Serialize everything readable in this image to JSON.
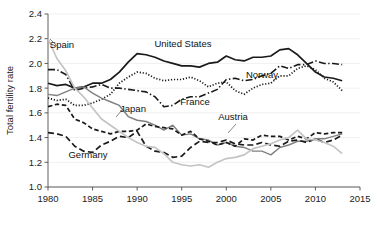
{
  "chart_data": {
    "type": "line",
    "title": "",
    "xlabel": "",
    "ylabel": "Total fertility rate",
    "xlim": [
      1980,
      2015
    ],
    "ylim": [
      1.0,
      2.4
    ],
    "grid": true,
    "legend_position": "inline-annotations",
    "xticks": [
      "1980",
      "1985",
      "1990",
      "1995",
      "2000",
      "2005",
      "2010",
      "2015"
    ],
    "xtick_values": [
      1980,
      1985,
      1990,
      1995,
      2000,
      2005,
      2010,
      2015
    ],
    "yticks": [
      "1.0",
      "1.2",
      "1.4",
      "1.6",
      "1.8",
      "2.0",
      "2.2",
      "2.4"
    ],
    "ytick_values": [
      1.0,
      1.2,
      1.4,
      1.6,
      1.8,
      2.0,
      2.2,
      2.4
    ],
    "x": [
      1980,
      1981,
      1982,
      1983,
      1984,
      1985,
      1986,
      1987,
      1988,
      1989,
      1990,
      1991,
      1992,
      1993,
      1994,
      1995,
      1996,
      1997,
      1998,
      1999,
      2000,
      2001,
      2002,
      2003,
      2004,
      2005,
      2006,
      2007,
      2008,
      2009,
      2010,
      2011,
      2012,
      2013
    ],
    "series": [
      {
        "name": "United States",
        "style": "solid",
        "color": "#1a1a1a",
        "label": "United States",
        "label_x": 183,
        "label_y": 47,
        "values": [
          1.84,
          1.82,
          1.83,
          1.8,
          1.81,
          1.84,
          1.84,
          1.87,
          1.93,
          2.01,
          2.08,
          2.07,
          2.05,
          2.02,
          2.0,
          1.98,
          1.98,
          1.97,
          2.0,
          2.01,
          2.06,
          2.03,
          2.02,
          2.05,
          2.05,
          2.06,
          2.11,
          2.12,
          2.07,
          2.0,
          1.93,
          1.89,
          1.88,
          1.86
        ]
      },
      {
        "name": "Norway",
        "style": "dotted",
        "color": "#1a1a1a",
        "label": "Norway",
        "label_x": 262,
        "label_y": 78,
        "values": [
          1.72,
          1.7,
          1.71,
          1.66,
          1.66,
          1.68,
          1.71,
          1.75,
          1.84,
          1.89,
          1.93,
          1.92,
          1.88,
          1.86,
          1.87,
          1.87,
          1.89,
          1.86,
          1.81,
          1.84,
          1.85,
          1.78,
          1.75,
          1.8,
          1.83,
          1.84,
          1.9,
          1.9,
          1.96,
          1.98,
          1.95,
          1.88,
          1.85,
          1.78
        ]
      },
      {
        "name": "France",
        "style": "dashdot",
        "color": "#1a1a1a",
        "label": "France",
        "label_x": 195,
        "label_y": 105,
        "values": [
          1.95,
          1.95,
          1.91,
          1.78,
          1.8,
          1.81,
          1.83,
          1.8,
          1.8,
          1.79,
          1.78,
          1.77,
          1.73,
          1.65,
          1.66,
          1.71,
          1.73,
          1.73,
          1.76,
          1.79,
          1.87,
          1.88,
          1.86,
          1.87,
          1.9,
          1.92,
          1.98,
          1.96,
          1.99,
          1.99,
          2.02,
          2.0,
          2.0,
          1.99
        ]
      },
      {
        "name": "Japan",
        "style": "solid-gray",
        "color": "#808080",
        "label": "Japan",
        "label_x": 133,
        "label_y": 112,
        "values": [
          1.75,
          1.74,
          1.77,
          1.8,
          1.81,
          1.76,
          1.72,
          1.69,
          1.66,
          1.57,
          1.54,
          1.53,
          1.5,
          1.46,
          1.5,
          1.42,
          1.43,
          1.39,
          1.38,
          1.34,
          1.36,
          1.33,
          1.32,
          1.29,
          1.29,
          1.26,
          1.32,
          1.34,
          1.37,
          1.37,
          1.39,
          1.39,
          1.41,
          1.43
        ]
      },
      {
        "name": "Germany",
        "style": "dashed",
        "color": "#1a1a1a",
        "label": "Germany",
        "label_x": 88,
        "label_y": 158,
        "values": [
          1.44,
          1.43,
          1.41,
          1.33,
          1.29,
          1.28,
          1.34,
          1.37,
          1.41,
          1.4,
          1.45,
          1.33,
          1.29,
          1.28,
          1.24,
          1.25,
          1.32,
          1.37,
          1.36,
          1.36,
          1.38,
          1.35,
          1.34,
          1.34,
          1.36,
          1.34,
          1.33,
          1.37,
          1.38,
          1.36,
          1.39,
          1.36,
          1.38,
          1.42
        ]
      },
      {
        "name": "Austria",
        "style": "dashed-short",
        "color": "#1a1a1a",
        "label": "Austria",
        "label_x": 233,
        "label_y": 120,
        "values": [
          1.65,
          1.67,
          1.66,
          1.55,
          1.52,
          1.47,
          1.45,
          1.43,
          1.45,
          1.45,
          1.46,
          1.51,
          1.49,
          1.48,
          1.47,
          1.42,
          1.45,
          1.39,
          1.37,
          1.34,
          1.36,
          1.33,
          1.39,
          1.38,
          1.42,
          1.41,
          1.41,
          1.38,
          1.41,
          1.39,
          1.44,
          1.43,
          1.44,
          1.44
        ]
      },
      {
        "name": "Spain",
        "style": "solid-lightgray",
        "color": "#c4c4c4",
        "label": "Spain",
        "label_x": 62,
        "label_y": 48,
        "values": [
          2.2,
          2.04,
          1.94,
          1.8,
          1.73,
          1.64,
          1.55,
          1.5,
          1.45,
          1.4,
          1.36,
          1.33,
          1.32,
          1.27,
          1.2,
          1.18,
          1.17,
          1.18,
          1.16,
          1.2,
          1.23,
          1.24,
          1.26,
          1.31,
          1.33,
          1.35,
          1.38,
          1.4,
          1.46,
          1.39,
          1.38,
          1.36,
          1.33,
          1.27
        ]
      }
    ]
  }
}
